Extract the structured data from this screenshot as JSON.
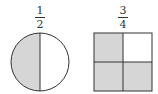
{
  "figures": [
    {
      "shape": "circle",
      "fraction": {
        "numerator": "1",
        "denominator": "2"
      },
      "parts": 2,
      "shaded_parts": 1
    },
    {
      "shape": "square",
      "fraction": {
        "numerator": "3",
        "denominator": "4"
      },
      "parts": 4,
      "shaded_parts": 3
    }
  ],
  "colors": {
    "shade": "#d6d6d6",
    "stroke": "#333333",
    "background": "#ffffff"
  }
}
